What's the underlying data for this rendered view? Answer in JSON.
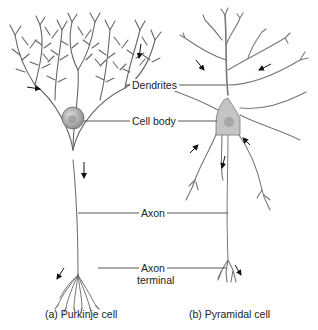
{
  "diagram": {
    "labels": {
      "dendrites": "Dendrites",
      "cell_body": "Cell body",
      "axon": "Axon",
      "axon_terminal_line1": "Axon",
      "axon_terminal_line2": "terminal"
    },
    "captions": {
      "left": "(a) Purkinje cell",
      "right": "(b) Pyramidal cell"
    },
    "colors": {
      "line": "#555555",
      "soma_fill": "#b8b8b8",
      "arrow": "#111111",
      "text": "#222222"
    }
  }
}
